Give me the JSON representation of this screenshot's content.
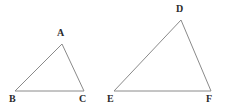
{
  "canvas": {
    "width": 229,
    "height": 110,
    "background_color": "#ffffff"
  },
  "style": {
    "line_color": "#8a8a8a",
    "line_width": 1,
    "label_color": "#2b2b2b",
    "label_font_size": 10
  },
  "figure": {
    "triangles": [
      {
        "id": "triangle-abc",
        "name": "ABC",
        "vertices": [
          {
            "label": "A",
            "x": 62,
            "y": 44,
            "label_x": 57,
            "label_y": 28,
            "role": "apex"
          },
          {
            "label": "B",
            "x": 15,
            "y": 91,
            "label_x": 9,
            "label_y": 94,
            "role": "base-left"
          },
          {
            "label": "C",
            "x": 84,
            "y": 91,
            "label_x": 79,
            "label_y": 94,
            "role": "base-right"
          }
        ]
      },
      {
        "id": "triangle-def",
        "name": "DEF",
        "vertices": [
          {
            "label": "D",
            "x": 181,
            "y": 20,
            "label_x": 176,
            "label_y": 4,
            "role": "apex"
          },
          {
            "label": "E",
            "x": 114,
            "y": 91,
            "label_x": 107,
            "label_y": 94,
            "role": "base-left"
          },
          {
            "label": "F",
            "x": 211,
            "y": 91,
            "label_x": 206,
            "label_y": 94,
            "role": "base-right"
          }
        ]
      }
    ]
  }
}
